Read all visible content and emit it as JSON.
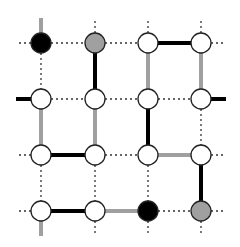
{
  "diagram": {
    "type": "lattice-graph",
    "grid": {
      "cols": 4,
      "rows": 4
    },
    "colors": {
      "black": "#000000",
      "gray": "#a0a0a0",
      "white": "#ffffff",
      "stroke": "#222222",
      "dotted": "#333333"
    },
    "columns_x": [
      41,
      95,
      148,
      201
    ],
    "rows_y": [
      43,
      99,
      155,
      211
    ],
    "nodes": [
      {
        "r": 0,
        "c": 0,
        "fill": "black"
      },
      {
        "r": 0,
        "c": 1,
        "fill": "gray"
      },
      {
        "r": 0,
        "c": 2,
        "fill": "white"
      },
      {
        "r": 0,
        "c": 3,
        "fill": "white"
      },
      {
        "r": 1,
        "c": 0,
        "fill": "white"
      },
      {
        "r": 1,
        "c": 1,
        "fill": "white"
      },
      {
        "r": 1,
        "c": 2,
        "fill": "white"
      },
      {
        "r": 1,
        "c": 3,
        "fill": "white"
      },
      {
        "r": 2,
        "c": 0,
        "fill": "white"
      },
      {
        "r": 2,
        "c": 1,
        "fill": "white"
      },
      {
        "r": 2,
        "c": 2,
        "fill": "white"
      },
      {
        "r": 2,
        "c": 3,
        "fill": "white"
      },
      {
        "r": 3,
        "c": 0,
        "fill": "white"
      },
      {
        "r": 3,
        "c": 1,
        "fill": "white"
      },
      {
        "r": 3,
        "c": 2,
        "fill": "black"
      },
      {
        "r": 3,
        "c": 3,
        "fill": "gray"
      }
    ],
    "edges": [
      {
        "from": [
          0,
          0
        ],
        "to": [
          0,
          1
        ],
        "style": "dotted"
      },
      {
        "from": [
          0,
          1
        ],
        "to": [
          0,
          2
        ],
        "style": "dotted"
      },
      {
        "from": [
          0,
          2
        ],
        "to": [
          0,
          3
        ],
        "style": "black"
      },
      {
        "from": [
          1,
          0
        ],
        "to": [
          1,
          1
        ],
        "style": "dotted"
      },
      {
        "from": [
          1,
          1
        ],
        "to": [
          1,
          2
        ],
        "style": "dotted"
      },
      {
        "from": [
          1,
          2
        ],
        "to": [
          1,
          3
        ],
        "style": "dotted"
      },
      {
        "from": [
          2,
          0
        ],
        "to": [
          2,
          1
        ],
        "style": "black"
      },
      {
        "from": [
          2,
          1
        ],
        "to": [
          2,
          2
        ],
        "style": "dotted"
      },
      {
        "from": [
          2,
          2
        ],
        "to": [
          2,
          3
        ],
        "style": "gray"
      },
      {
        "from": [
          3,
          0
        ],
        "to": [
          3,
          1
        ],
        "style": "black"
      },
      {
        "from": [
          3,
          1
        ],
        "to": [
          3,
          2
        ],
        "style": "gray"
      },
      {
        "from": [
          3,
          2
        ],
        "to": [
          3,
          3
        ],
        "style": "dotted"
      },
      {
        "from": [
          0,
          0
        ],
        "to": [
          1,
          0
        ],
        "style": "dotted"
      },
      {
        "from": [
          1,
          0
        ],
        "to": [
          2,
          0
        ],
        "style": "gray"
      },
      {
        "from": [
          2,
          0
        ],
        "to": [
          3,
          0
        ],
        "style": "dotted"
      },
      {
        "from": [
          0,
          1
        ],
        "to": [
          1,
          1
        ],
        "style": "black"
      },
      {
        "from": [
          1,
          1
        ],
        "to": [
          2,
          1
        ],
        "style": "gray"
      },
      {
        "from": [
          2,
          1
        ],
        "to": [
          3,
          1
        ],
        "style": "dotted"
      },
      {
        "from": [
          0,
          2
        ],
        "to": [
          1,
          2
        ],
        "style": "gray"
      },
      {
        "from": [
          1,
          2
        ],
        "to": [
          2,
          2
        ],
        "style": "black"
      },
      {
        "from": [
          2,
          2
        ],
        "to": [
          3,
          2
        ],
        "style": "dotted"
      },
      {
        "from": [
          0,
          3
        ],
        "to": [
          1,
          3
        ],
        "style": "gray"
      },
      {
        "from": [
          1,
          3
        ],
        "to": [
          2,
          3
        ],
        "style": "dotted"
      },
      {
        "from": [
          2,
          3
        ],
        "to": [
          3,
          3
        ],
        "style": "black"
      }
    ],
    "boundary_stubs": [
      {
        "node": [
          0,
          0
        ],
        "dir": "up",
        "style": "gray"
      },
      {
        "node": [
          0,
          1
        ],
        "dir": "up",
        "style": "dotted"
      },
      {
        "node": [
          0,
          2
        ],
        "dir": "up",
        "style": "dotted"
      },
      {
        "node": [
          0,
          3
        ],
        "dir": "up",
        "style": "dotted"
      },
      {
        "node": [
          0,
          0
        ],
        "dir": "left",
        "style": "dotted"
      },
      {
        "node": [
          0,
          3
        ],
        "dir": "right",
        "style": "dotted"
      },
      {
        "node": [
          1,
          0
        ],
        "dir": "left",
        "style": "black"
      },
      {
        "node": [
          1,
          3
        ],
        "dir": "right",
        "style": "black"
      },
      {
        "node": [
          2,
          0
        ],
        "dir": "left",
        "style": "dotted"
      },
      {
        "node": [
          2,
          3
        ],
        "dir": "right",
        "style": "dotted"
      },
      {
        "node": [
          3,
          0
        ],
        "dir": "left",
        "style": "dotted"
      },
      {
        "node": [
          3,
          3
        ],
        "dir": "right",
        "style": "dotted"
      },
      {
        "node": [
          3,
          0
        ],
        "dir": "down",
        "style": "gray"
      },
      {
        "node": [
          3,
          1
        ],
        "dir": "down",
        "style": "dotted"
      },
      {
        "node": [
          3,
          2
        ],
        "dir": "down",
        "style": "dotted"
      },
      {
        "node": [
          3,
          3
        ],
        "dir": "down",
        "style": "dotted"
      }
    ]
  }
}
